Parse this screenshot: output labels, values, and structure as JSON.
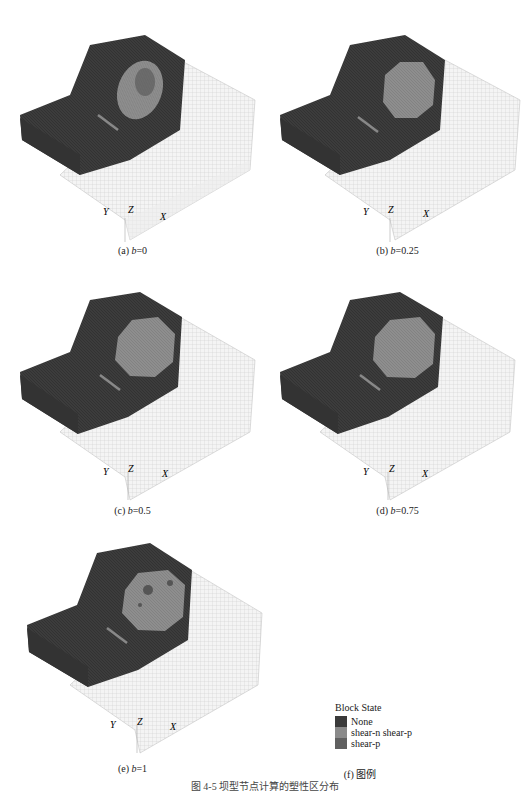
{
  "panels": [
    {
      "id": "a",
      "label_prefix": "(a) ",
      "var": "b",
      "value": "=0",
      "zone": "ring",
      "axes": {
        "y": "Y",
        "z": "Z",
        "x": "X"
      }
    },
    {
      "id": "b",
      "label_prefix": "(b) ",
      "var": "b",
      "value": "=0.25",
      "zone": "solid",
      "axes": {
        "y": "Y",
        "z": "Z",
        "x": "X"
      }
    },
    {
      "id": "c",
      "label_prefix": "(c) ",
      "var": "b",
      "value": "=0.5",
      "zone": "solid",
      "axes": {
        "y": "Y",
        "z": "Z",
        "x": "X"
      }
    },
    {
      "id": "d",
      "label_prefix": "(d) ",
      "var": "b",
      "value": "=0.75",
      "zone": "solid",
      "axes": {
        "y": "Y",
        "z": "Z",
        "x": "X"
      }
    },
    {
      "id": "e",
      "label_prefix": "(e) ",
      "var": "b",
      "value": "=1",
      "zone": "spotty",
      "axes": {
        "y": "Y",
        "z": "Z",
        "x": "X"
      }
    }
  ],
  "legend": {
    "title": "Block State",
    "items": [
      {
        "label": "None",
        "color": "#3a3a3a"
      },
      {
        "label": "shear-n shear-p",
        "color": "#8a8a8a"
      },
      {
        "label": "shear-p",
        "color": "#606060"
      }
    ],
    "caption": "(f) 图例"
  },
  "figure_caption": "图 4-5  坝型节点计算的塑性区分布",
  "colors": {
    "rock_dark": "#3a3a3a",
    "plastic_zone": "#8c8c8c",
    "mesh_light": "#f2f2f2",
    "mesh_line": "#c8c8c8"
  }
}
